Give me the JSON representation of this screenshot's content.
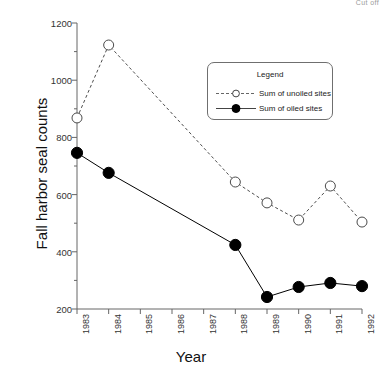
{
  "corner_note": "Cut off",
  "chart_data": {
    "type": "line",
    "title": "",
    "xlabel": "Year",
    "ylabel": "Fall harbor seal counts",
    "categories": [
      "1983",
      "1984",
      "1985",
      "1986",
      "1987",
      "1988",
      "1989",
      "1990",
      "1991",
      "1992"
    ],
    "x": [
      1983,
      1984,
      1985,
      1986,
      1987,
      1988,
      1989,
      1990,
      1991,
      1992
    ],
    "xlim": [
      1983,
      1992
    ],
    "ylim": [
      200,
      1200
    ],
    "yticks": [
      200,
      400,
      600,
      800,
      1000,
      1200
    ],
    "ytick_labels": [
      "200",
      "400",
      "600",
      "800",
      "1000",
      "1200"
    ],
    "y_minor_ticks": [
      300,
      500,
      700,
      900,
      1100
    ],
    "grid": false,
    "legend_position": "upper-right-inside",
    "legend_title": "Legend",
    "series": [
      {
        "name": "Sum of unoiled sites",
        "marker": "open-circle",
        "line_style": "dashed",
        "color": "#4d4d4d",
        "x": [
          1983,
          1984,
          1988,
          1989,
          1990,
          1991,
          1992
        ],
        "values": [
          868,
          1123,
          644,
          571,
          511,
          630,
          504
        ]
      },
      {
        "name": "Sum of oiled sites",
        "marker": "filled-circle",
        "line_style": "solid",
        "color": "#000000",
        "x": [
          1983,
          1984,
          1988,
          1989,
          1990,
          1991,
          1992
        ],
        "values": [
          746,
          676,
          424,
          242,
          277,
          291,
          280
        ]
      }
    ]
  },
  "legend": {
    "title": "Legend",
    "items": [
      {
        "label": "Sum of unoiled sites"
      },
      {
        "label": "Sum of oiled sites"
      }
    ]
  }
}
